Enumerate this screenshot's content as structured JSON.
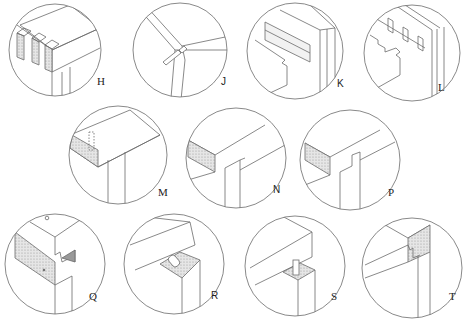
{
  "figure": {
    "colors": {
      "line": "#6b6b6b",
      "stipple": "#d9d9d9",
      "background": "#ffffff"
    },
    "vignettes": [
      {
        "id": "H",
        "label": "H",
        "subject": "box-joint-corner"
      },
      {
        "id": "J",
        "label": "J",
        "subject": "mitre-spline-corner"
      },
      {
        "id": "K",
        "label": "K",
        "subject": "rebate-groove-corner"
      },
      {
        "id": "L",
        "label": "L",
        "subject": "multiple-tongue-corner"
      },
      {
        "id": "M",
        "label": "M",
        "subject": "dowelled-butt-corner"
      },
      {
        "id": "N",
        "label": "N",
        "subject": "housed-corner"
      },
      {
        "id": "P",
        "label": "P",
        "subject": "rebated-corner"
      },
      {
        "id": "Q",
        "label": "Q",
        "subject": "halved-dovetail-corner"
      },
      {
        "id": "R",
        "label": "R",
        "subject": "knock-down-fitting-corner"
      },
      {
        "id": "S",
        "label": "S",
        "subject": "dowel-post-corner"
      },
      {
        "id": "T",
        "label": "T",
        "subject": "tongued-housing-corner"
      }
    ]
  }
}
